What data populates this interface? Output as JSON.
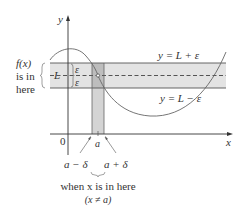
{
  "figure": {
    "colors": {
      "band_fill": "#e3e3e3",
      "strip_fill": "#d4d4d4",
      "overlap_fill": "#bdbdbd",
      "line": "#555555",
      "curve": "#666666",
      "axis": "#333333"
    },
    "axes": {
      "x_label": "x",
      "y_label": "y",
      "origin_label": "0"
    },
    "band": {
      "upper_label": "y = L + ε",
      "lower_label": "y = L − ε",
      "center_label": "L",
      "eps_upper": "ε",
      "eps_lower": "ε"
    },
    "left_annotation": {
      "line1": "f(x)",
      "line2": "is in",
      "line3": "here"
    },
    "strip": {
      "center_label": "a",
      "left_label": "a − δ",
      "right_label": "a + δ"
    },
    "bottom_annotation": {
      "line1": "when x is in here",
      "line2": "(x ≠ a)"
    }
  }
}
